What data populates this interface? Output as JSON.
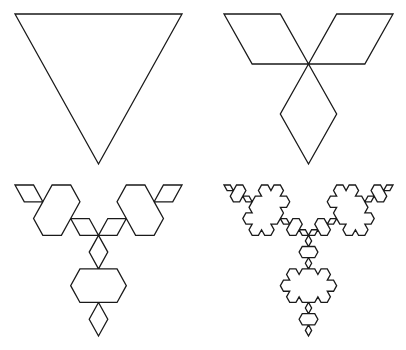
{
  "figure": {
    "stroke_color": "#1a1a1a",
    "background_color": "#ffffff",
    "panels": [
      {
        "iteration": 0,
        "name": "iteration-0-triangle",
        "top_left": [
          15,
          14
        ],
        "top_right": [
          182,
          14
        ],
        "bottom": [
          98,
          164
        ]
      },
      {
        "iteration": 1,
        "name": "iteration-1-three-rhombi",
        "top_left": [
          224,
          14
        ],
        "top_right": [
          393,
          14
        ],
        "bottom": [
          309,
          164
        ]
      },
      {
        "iteration": 2,
        "name": "iteration-2-hexagons",
        "top_left": [
          15,
          185
        ],
        "top_right": [
          182,
          185
        ],
        "bottom": [
          98,
          336
        ]
      },
      {
        "iteration": 3,
        "name": "iteration-3-snowflake-clusters",
        "top_left": [
          224,
          185
        ],
        "top_right": [
          393,
          185
        ],
        "bottom": [
          309,
          336
        ]
      }
    ]
  }
}
